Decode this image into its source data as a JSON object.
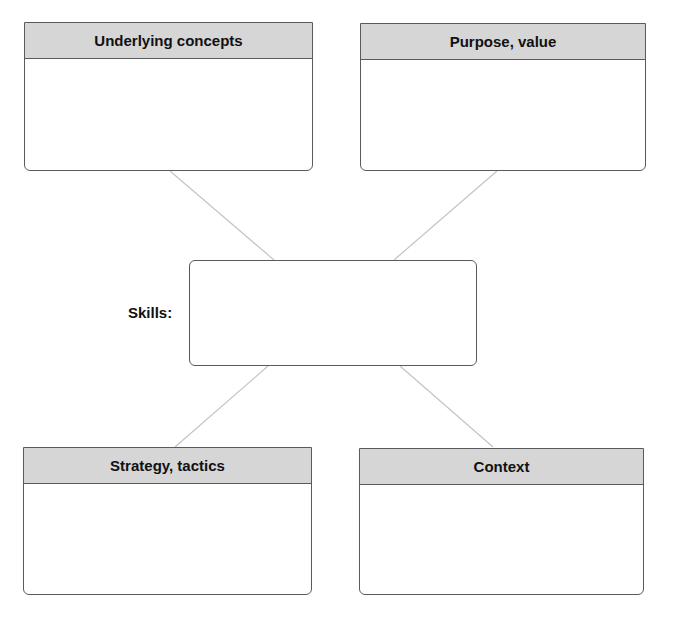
{
  "diagram": {
    "center": {
      "label": "Skills:"
    },
    "boxes": [
      {
        "title": "Underlying concepts",
        "content": ""
      },
      {
        "title": "Purpose, value",
        "content": ""
      },
      {
        "title": "Strategy, tactics",
        "content": ""
      },
      {
        "title": "Context",
        "content": ""
      }
    ]
  },
  "colors": {
    "header_fill": "#d6d6d6",
    "border": "#5a5a5a",
    "connector": "#c4c4c4"
  }
}
